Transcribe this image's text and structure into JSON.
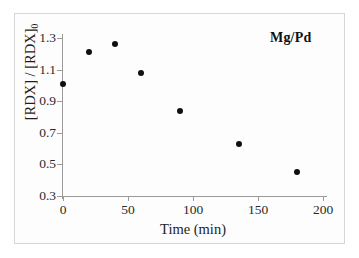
{
  "figure": {
    "annotation": "Mg/Pd"
  },
  "chart_data": {
    "type": "scatter",
    "title": "",
    "subtitle": "",
    "xlabel": "Time (min)",
    "ylabel": "[RDX] / [RDX]0",
    "ylabel_base": "[RDX] / [RDX]",
    "ylabel_sub": "0",
    "legend": [
      "Mg/Pd"
    ],
    "legend_position": "top-right",
    "annotations": [
      "Mg/Pd"
    ],
    "grid": false,
    "xlim": [
      0,
      200
    ],
    "ylim": [
      0.3,
      1.3
    ],
    "xticks": [
      0,
      50,
      100,
      150,
      200
    ],
    "xtick_labels": [
      "0",
      "50",
      "100",
      "150",
      "200"
    ],
    "yticks": [
      0.3,
      0.5,
      0.7,
      0.9,
      1.1,
      1.3
    ],
    "ytick_labels": [
      "0.3",
      "0.5",
      "0.7",
      "0.9",
      "1.1",
      "1.3"
    ],
    "series": [
      {
        "name": "Mg/Pd",
        "marker": "filled-circle",
        "color": "#101010",
        "x": [
          0,
          20,
          40,
          60,
          90,
          135,
          180
        ],
        "y": [
          1.01,
          1.21,
          1.26,
          1.08,
          0.84,
          0.63,
          0.45
        ]
      }
    ]
  }
}
